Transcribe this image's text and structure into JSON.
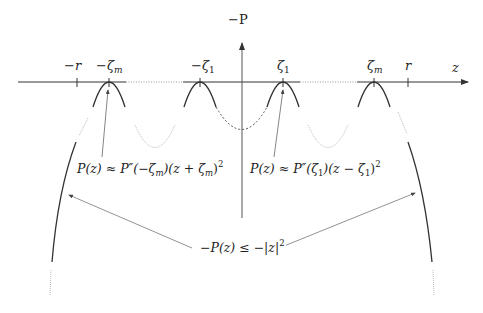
{
  "diagram": {
    "axes": {
      "horizontal_label": "z",
      "vertical_label": "−P"
    },
    "ticks": [
      {
        "id": "neg-r",
        "label": "−r"
      },
      {
        "id": "neg-zeta-m",
        "label": "−ζ",
        "sub": "m"
      },
      {
        "id": "neg-zeta-1",
        "label": "−ζ",
        "sub": "1"
      },
      {
        "id": "zeta-1",
        "label": "ζ",
        "sub": "1"
      },
      {
        "id": "zeta-m",
        "label": "ζ",
        "sub": "m"
      },
      {
        "id": "r",
        "label": "r"
      }
    ],
    "annotations": {
      "left_approx": "P(z) ≈ P″(−ζ_m)(z + ζ_m)²",
      "left_approx_parts": [
        "P(z) ≈ P″(−ζ",
        "m",
        ")(z + ζ",
        "m",
        ")",
        "2"
      ],
      "right_approx": "P(z) ≈ P″(ζ_1)(z − ζ_1)²",
      "right_approx_parts": [
        "P(z) ≈ P″(ζ",
        "1",
        ")(z − ζ",
        "1",
        ")",
        "2"
      ],
      "bound": "−P(z) ≤ −|z|²",
      "bound_parts": [
        "−P(z) ≤ −|z|",
        "2"
      ]
    },
    "colors": {
      "ink": "#222222",
      "faint": "#bbbbbb",
      "dashed": "#555555"
    }
  }
}
